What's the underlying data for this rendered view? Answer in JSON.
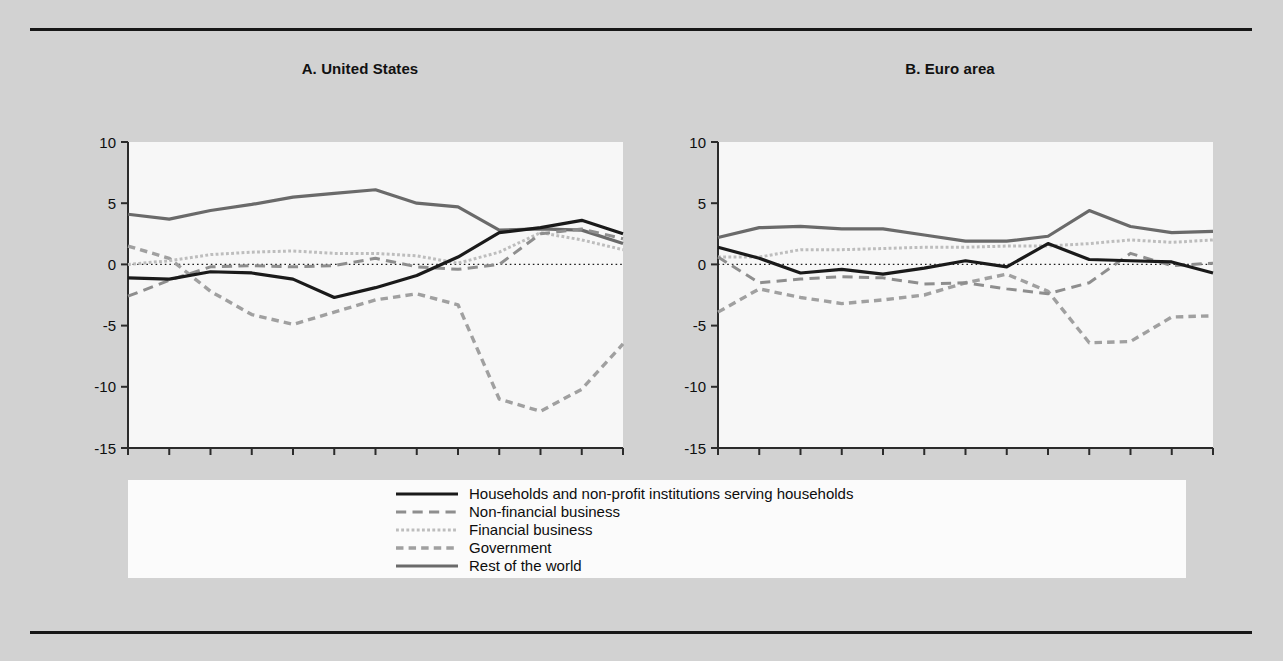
{
  "figure": {
    "background_color": "#d2d2d2",
    "plot_background_color": "#f7f7f7",
    "rule_color": "#171717"
  },
  "legend": {
    "position": "below-panels",
    "entries": [
      {
        "label": "Households and non-profit institutions serving households",
        "style": "solid",
        "color": "#1a1a1a",
        "width": 3.2
      },
      {
        "label": "Non-financial business",
        "style": "long-dash",
        "color": "#8e8e8e",
        "width": 3.0
      },
      {
        "label": "Financial business",
        "style": "dotted",
        "color": "#bdbdbd",
        "width": 3.0
      },
      {
        "label": "Government",
        "style": "short-dash",
        "color": "#a0a0a0",
        "width": 3.4
      },
      {
        "label": "Rest of the world",
        "style": "solid",
        "color": "#6a6a6a",
        "width": 3.2
      }
    ]
  },
  "chart_data": [
    {
      "type": "line",
      "title": "A. United States",
      "panel_id": "A",
      "xlabel": "",
      "ylabel": "",
      "x": [
        2000,
        2001,
        2002,
        2003,
        2004,
        2005,
        2006,
        2007,
        2008,
        2009,
        2010,
        2011,
        2012
      ],
      "xlim": [
        2000,
        2012
      ],
      "ylim": [
        -15,
        10
      ],
      "yticks": [
        10,
        5,
        0,
        -5,
        -10,
        -15
      ],
      "xticks": [
        2000,
        2002,
        2004,
        2006,
        2008,
        2010,
        2012
      ],
      "xtick_labels": [
        "2000",
        "2002",
        "2004",
        "2006",
        "2008",
        "2010",
        "2012"
      ],
      "ytick_labels": [
        "10",
        "5",
        "0",
        "-5",
        "-10",
        "-15"
      ],
      "grid": false,
      "zero_line": true,
      "series": [
        {
          "name": "Households and non-profit institutions serving households",
          "values": [
            -1.1,
            -1.2,
            -0.6,
            -0.7,
            -1.2,
            -2.7,
            -1.9,
            -0.9,
            0.6,
            2.6,
            3.0,
            3.6,
            2.5
          ]
        },
        {
          "name": "Non-financial business",
          "values": [
            -2.6,
            -1.3,
            -0.2,
            -0.1,
            -0.2,
            -0.1,
            0.5,
            -0.2,
            -0.4,
            0.0,
            2.5,
            2.9,
            2.1
          ]
        },
        {
          "name": "Financial business",
          "values": [
            0.0,
            0.3,
            0.8,
            1.0,
            1.1,
            0.9,
            0.9,
            0.7,
            0.1,
            1.0,
            2.6,
            2.0,
            1.2
          ]
        },
        {
          "name": "Government",
          "values": [
            1.5,
            0.5,
            -2.2,
            -4.1,
            -4.9,
            -3.9,
            -2.9,
            -2.4,
            -3.3,
            -11.0,
            -12.0,
            -10.2,
            -6.5
          ]
        },
        {
          "name": "Rest of the world",
          "values": [
            4.1,
            3.7,
            4.4,
            4.9,
            5.5,
            5.8,
            6.1,
            5.0,
            4.7,
            2.8,
            2.9,
            2.8,
            1.7
          ]
        }
      ]
    },
    {
      "type": "line",
      "title": "B. Euro area",
      "panel_id": "B",
      "xlabel": "",
      "ylabel": "",
      "x": [
        2000,
        2001,
        2002,
        2003,
        2004,
        2005,
        2006,
        2007,
        2008,
        2009,
        2010,
        2011,
        2012
      ],
      "xlim": [
        2000,
        2012
      ],
      "ylim": [
        -15,
        10
      ],
      "yticks": [
        10,
        5,
        0,
        -5,
        -10,
        -15
      ],
      "xticks": [
        2000,
        2002,
        2004,
        2006,
        2008,
        2010,
        2012
      ],
      "xtick_labels": [
        "2000",
        "2002",
        "2004",
        "2006",
        "2008",
        "2010",
        "2012"
      ],
      "ytick_labels": [
        "10",
        "5",
        "0",
        "-5",
        "-10",
        "-15"
      ],
      "grid": false,
      "zero_line": true,
      "series": [
        {
          "name": "Households and non-profit institutions serving households",
          "values": [
            1.4,
            0.5,
            -0.7,
            -0.4,
            -0.8,
            -0.3,
            0.3,
            -0.2,
            1.7,
            0.4,
            0.3,
            0.2,
            -0.7
          ]
        },
        {
          "name": "Non-financial business",
          "values": [
            0.6,
            -1.5,
            -1.2,
            -1.0,
            -1.1,
            -1.6,
            -1.5,
            -2.0,
            -2.4,
            -1.5,
            0.9,
            -0.1,
            0.1
          ]
        },
        {
          "name": "Financial business",
          "values": [
            0.6,
            0.6,
            1.2,
            1.2,
            1.3,
            1.4,
            1.4,
            1.5,
            1.5,
            1.7,
            2.0,
            1.8,
            2.0
          ]
        },
        {
          "name": "Government",
          "values": [
            -3.9,
            -2.0,
            -2.7,
            -3.2,
            -2.9,
            -2.5,
            -1.5,
            -0.8,
            -2.2,
            -6.4,
            -6.3,
            -4.3,
            -4.2
          ]
        },
        {
          "name": "Rest of the world",
          "values": [
            2.2,
            3.0,
            3.1,
            2.9,
            2.9,
            2.4,
            1.9,
            1.9,
            2.3,
            4.4,
            3.1,
            2.6,
            2.7
          ]
        }
      ]
    }
  ]
}
